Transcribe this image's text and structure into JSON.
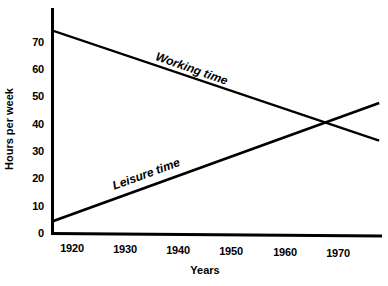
{
  "chart_data": {
    "type": "line",
    "title": "",
    "xlabel": "Years",
    "ylabel": "Hours per week",
    "xlim": [
      1916,
      1975
    ],
    "ylim": [
      0,
      78
    ],
    "grid": false,
    "legend_position": "inline-labels",
    "x_ticks": [
      "1920",
      "1930",
      "1940",
      "1950",
      "1960",
      "1970"
    ],
    "x_tick_values": [
      1920,
      1930,
      1940,
      1950,
      1960,
      1970
    ],
    "y_ticks": [
      "0",
      "10",
      "20",
      "30",
      "40",
      "50",
      "60",
      "70"
    ],
    "y_tick_values": [
      0,
      10,
      20,
      30,
      40,
      50,
      60,
      70
    ],
    "series": [
      {
        "name": "Working time",
        "label": "Working time",
        "color": "#000000",
        "x": [
          1916,
          1975
        ],
        "values": [
          74,
          34
        ]
      },
      {
        "name": "Leisure time",
        "label": "Leisure time",
        "color": "#000000",
        "x": [
          1916,
          1975
        ],
        "values": [
          4.5,
          47.5
        ]
      }
    ],
    "annotations": [
      {
        "text": "Working time",
        "x": 1936,
        "y": 62
      },
      {
        "text": "Leisure time",
        "x": 1930,
        "y": 22
      }
    ],
    "intersection": {
      "x": 1966,
      "y": 41
    }
  },
  "axes": {
    "y_title": "Hours per week",
    "x_title": "Years",
    "y_tick_labels": [
      "70",
      "60",
      "50",
      "40",
      "30",
      "20",
      "10",
      "0"
    ],
    "x_tick_labels": [
      "1920",
      "1930",
      "1940",
      "1950",
      "1960",
      "1970"
    ]
  },
  "labels": {
    "working_time": "Working time",
    "leisure_time": "Leisure time"
  },
  "colors": {
    "line": "#000000",
    "axis": "#000000",
    "background": "#ffffff"
  }
}
